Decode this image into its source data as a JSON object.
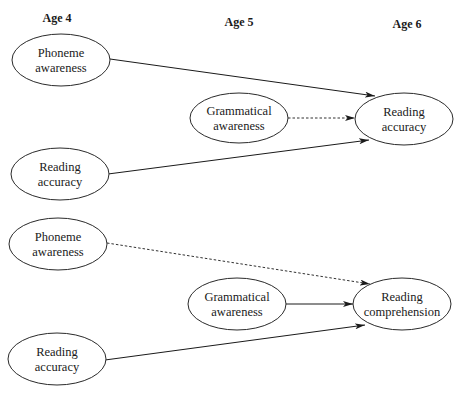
{
  "diagram": {
    "age_labels": [
      {
        "label": "Age 4",
        "x": 57,
        "y": 22
      },
      {
        "label": "Age 5",
        "x": 239,
        "y": 26
      },
      {
        "label": "Age 6",
        "x": 407,
        "y": 28
      }
    ],
    "panels": [
      {
        "name": "reading-accuracy-model",
        "nodes": [
          {
            "id": "p1-phoneme",
            "lines": [
              "Phoneme",
              "awareness"
            ],
            "age": "Age 4",
            "cx": 61,
            "cy": 60,
            "rx": 49,
            "ry": 26
          },
          {
            "id": "p1-reading",
            "lines": [
              "Reading",
              "accuracy"
            ],
            "age": "Age 4",
            "cx": 60,
            "cy": 174,
            "rx": 49,
            "ry": 26
          },
          {
            "id": "p1-grammatical",
            "lines": [
              "Grammatical",
              "awareness"
            ],
            "age": "Age 5",
            "cx": 239,
            "cy": 118,
            "rx": 49,
            "ry": 25
          },
          {
            "id": "p1-outcome",
            "lines": [
              "Reading",
              "accuracy"
            ],
            "age": "Age 6",
            "cx": 404,
            "cy": 119,
            "rx": 49,
            "ry": 26
          }
        ],
        "edges": [
          {
            "from": "Phoneme awareness",
            "to": "Reading accuracy",
            "style": "solid",
            "x1": 110,
            "y1": 59,
            "x2": 375,
            "y2": 96
          },
          {
            "from": "Grammatical awareness",
            "to": "Reading accuracy",
            "style": "dashed",
            "x1": 288,
            "y1": 118,
            "x2": 355,
            "y2": 118
          },
          {
            "from": "Reading accuracy",
            "to": "Reading accuracy",
            "style": "solid",
            "x1": 108,
            "y1": 174,
            "x2": 369,
            "y2": 140
          }
        ]
      },
      {
        "name": "reading-comprehension-model",
        "nodes": [
          {
            "id": "p2-phoneme",
            "lines": [
              "Phoneme",
              "awareness"
            ],
            "age": "Age 4",
            "cx": 58,
            "cy": 244,
            "rx": 49,
            "ry": 26
          },
          {
            "id": "p2-reading",
            "lines": [
              "Reading",
              "accuracy"
            ],
            "age": "Age 4",
            "cx": 57,
            "cy": 359,
            "rx": 49,
            "ry": 26
          },
          {
            "id": "p2-grammatical",
            "lines": [
              "Grammatical",
              "awareness"
            ],
            "age": "Age 5",
            "cx": 237,
            "cy": 304,
            "rx": 49,
            "ry": 26
          },
          {
            "id": "p2-outcome",
            "lines": [
              "Reading",
              "comprehension"
            ],
            "age": "Age 6",
            "cx": 402,
            "cy": 304,
            "rx": 49,
            "ry": 26
          }
        ],
        "edges": [
          {
            "from": "Phoneme awareness",
            "to": "Reading comprehension",
            "style": "dashed",
            "x1": 107,
            "y1": 243,
            "x2": 370,
            "y2": 284
          },
          {
            "from": "Grammatical awareness",
            "to": "Reading comprehension",
            "style": "solid",
            "x1": 286,
            "y1": 304,
            "x2": 353,
            "y2": 304
          },
          {
            "from": "Reading accuracy",
            "to": "Reading comprehension",
            "style": "solid",
            "x1": 105,
            "y1": 360,
            "x2": 365,
            "y2": 325
          }
        ]
      }
    ]
  }
}
